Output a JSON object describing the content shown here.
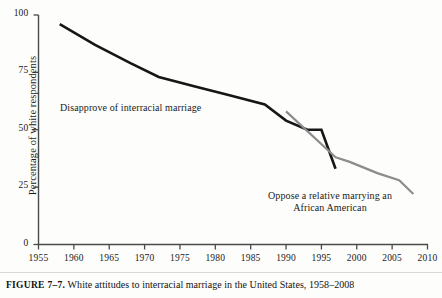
{
  "figure": {
    "caption_label": "FIGURE 7–7.",
    "caption_text": " White attitudes to interracial marriage in the United States, 1958–2008"
  },
  "chart_data": {
    "type": "line",
    "title": "",
    "xlabel": "",
    "ylabel": "Percentage of white respondents",
    "xlim": [
      1955,
      2010
    ],
    "ylim": [
      0,
      100
    ],
    "grid": false,
    "legend_position": "inline-annotations",
    "xticks": [
      "1955",
      "1960",
      "1965",
      "1970",
      "1975",
      "1980",
      "1985",
      "1990",
      "1995",
      "2000",
      "2005",
      "2010"
    ],
    "yticks": [
      "0",
      "25",
      "50",
      "75",
      "100"
    ],
    "series": [
      {
        "name": "Disapprove of interracial marriage",
        "color": "#161616",
        "width": 2.6,
        "x": [
          1958,
          1963,
          1968,
          1972,
          1977,
          1982,
          1987,
          1990,
          1993,
          1995,
          1997
        ],
        "y": [
          96,
          87,
          79,
          73,
          69,
          65,
          61,
          54,
          50,
          50,
          33
        ]
      },
      {
        "name": "Oppose a relative marrying an African American",
        "color": "#8c8c8c",
        "width": 2.2,
        "x": [
          1990,
          1997,
          1999,
          2003,
          2006,
          2008
        ],
        "y": [
          58,
          38,
          36,
          31,
          28,
          22
        ]
      }
    ],
    "annotations": [
      {
        "text": "Disapprove of interracial marriage",
        "x": 1963,
        "y": 52
      },
      {
        "text": "Oppose a relative marrying an\nAfrican American",
        "x": 1998,
        "y": 20
      }
    ]
  }
}
